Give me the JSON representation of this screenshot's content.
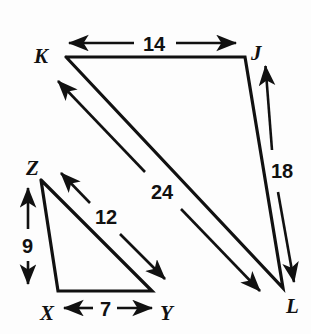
{
  "figure": {
    "background_color": "#fdfdfd",
    "line_color": "#111111",
    "vertices": [
      {
        "id": "K",
        "label": "K",
        "x": 66,
        "y": 57,
        "label_x": 34,
        "label_y": 63
      },
      {
        "id": "J",
        "label": "J",
        "x": 245,
        "y": 57,
        "label_x": 251,
        "label_y": 60
      },
      {
        "id": "L",
        "label": "L",
        "x": 283,
        "y": 288,
        "label_x": 286,
        "label_y": 313
      },
      {
        "id": "Z",
        "label": "Z",
        "x": 41,
        "y": 180,
        "label_x": 26,
        "label_y": 175
      },
      {
        "id": "X",
        "label": "X",
        "x": 58,
        "y": 291,
        "label_x": 40,
        "label_y": 320
      },
      {
        "id": "Y",
        "label": "Y",
        "x": 152,
        "y": 291,
        "label_x": 160,
        "label_y": 320
      }
    ],
    "triangles": [
      {
        "name": "triangle-JKL",
        "points": "66,57 245,57 283,288"
      },
      {
        "name": "triangle-XYZ",
        "points": "41,180 152,291 58,291"
      }
    ],
    "measurements": [
      {
        "id": "KJ",
        "value": "14",
        "label_x": 143,
        "label_y": 51,
        "arrow_type": "double",
        "x1": 68,
        "y1": 43,
        "x2": 237,
        "y2": 43,
        "gap_start": 134,
        "gap_end": 176
      },
      {
        "id": "JL",
        "value": "18",
        "label_x": 271,
        "label_y": 178,
        "arrow_type": "double",
        "x1": 265,
        "y1": 63,
        "x2": 295,
        "y2": 284,
        "gap_start_x": 272,
        "gap_start_y": 148,
        "gap_end_x": 278,
        "gap_end_y": 190
      },
      {
        "id": "KL",
        "value": "24",
        "label_x": 151,
        "label_y": 199,
        "arrow_type": "double",
        "x1": 56,
        "y1": 79,
        "x2": 262,
        "y2": 293,
        "gap_start_x": 143,
        "gap_start_y": 170,
        "gap_end_x": 181,
        "gap_end_y": 209
      },
      {
        "id": "ZY",
        "value": "12",
        "label_x": 95,
        "label_y": 224,
        "arrow_type": "double",
        "x1": 59,
        "y1": 171,
        "x2": 167,
        "y2": 281,
        "gap_start_x": 89,
        "gap_start_y": 202,
        "gap_end_x": 119,
        "gap_end_y": 233
      },
      {
        "id": "ZX",
        "value": "9",
        "label_x": 22,
        "label_y": 253,
        "arrow_type": "double",
        "x1": 28,
        "y1": 186,
        "x2": 28,
        "y2": 286,
        "gap_start": 228,
        "gap_end": 262
      },
      {
        "id": "XY",
        "value": "7",
        "label_x": 100,
        "label_y": 316,
        "arrow_type": "double",
        "x1": 62,
        "y1": 308,
        "x2": 154,
        "y2": 308,
        "gap_start": 92,
        "gap_end": 118
      }
    ]
  }
}
